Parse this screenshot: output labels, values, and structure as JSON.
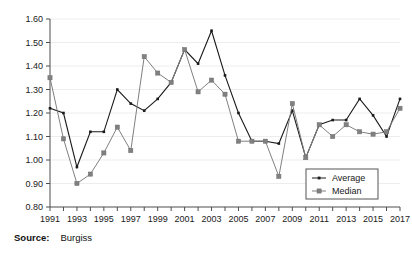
{
  "source": {
    "label": "Source:",
    "value": "Burgiss"
  },
  "legend": {
    "position": "inside-bottom-right",
    "entries": [
      {
        "name": "Average",
        "marker": "diamond-small",
        "color": "#1a1a1a"
      },
      {
        "name": "Median",
        "marker": "square",
        "color": "#808080"
      }
    ]
  },
  "axes": {
    "y_ticks": [
      "0.80",
      "0.90",
      "1.00",
      "1.10",
      "1.20",
      "1.30",
      "1.40",
      "1.50",
      "1.60"
    ],
    "x_ticks": [
      "1991",
      "1993",
      "1995",
      "1997",
      "1999",
      "2001",
      "2003",
      "2005",
      "2007",
      "2009",
      "2011",
      "2013",
      "2015",
      "2017"
    ]
  },
  "chart_data": {
    "type": "line",
    "title": "",
    "xlabel": "",
    "ylabel": "",
    "ylim": [
      0.8,
      1.6
    ],
    "ytick_interval": 0.1,
    "grid": "horizontal",
    "legend_position": "inside-bottom-right",
    "x": [
      1991,
      1992,
      1993,
      1994,
      1995,
      1996,
      1997,
      1998,
      1999,
      2000,
      2001,
      2002,
      2003,
      2004,
      2005,
      2006,
      2007,
      2008,
      2009,
      2010,
      2011,
      2012,
      2013,
      2014,
      2015,
      2016,
      2017
    ],
    "series": [
      {
        "name": "Average",
        "color": "#1a1a1a",
        "values": [
          1.22,
          1.2,
          0.97,
          1.12,
          1.12,
          1.3,
          1.24,
          1.21,
          1.26,
          1.33,
          1.47,
          1.41,
          1.55,
          1.36,
          1.2,
          1.08,
          1.08,
          1.07,
          1.21,
          1.01,
          1.15,
          1.17,
          1.17,
          1.26,
          1.19,
          1.1,
          1.26
        ]
      },
      {
        "name": "Median",
        "color": "#808080",
        "values": [
          1.35,
          1.09,
          0.9,
          0.94,
          1.03,
          1.14,
          1.04,
          1.44,
          1.37,
          1.33,
          1.47,
          1.29,
          1.34,
          1.28,
          1.08,
          1.08,
          1.08,
          0.93,
          1.24,
          1.01,
          1.15,
          1.1,
          1.15,
          1.12,
          1.11,
          1.12,
          1.22
        ]
      }
    ]
  }
}
